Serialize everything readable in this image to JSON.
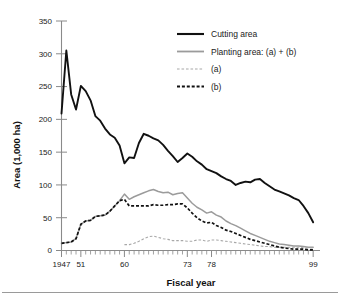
{
  "chart_data": {
    "type": "line",
    "title": "",
    "xlabel": "Fiscal year",
    "ylabel": "Area (1,000 ha)",
    "xlim": [
      1947,
      2000
    ],
    "ylim": [
      0,
      350
    ],
    "yticks": [
      0,
      50,
      100,
      150,
      200,
      250,
      300,
      350
    ],
    "ytick_labels": [
      "0",
      "50",
      "100",
      "150",
      "200",
      "250",
      "300",
      "350"
    ],
    "xticks": [
      1947,
      1951,
      1960,
      1973,
      1978,
      1999
    ],
    "xtick_labels": [
      "1947",
      "51",
      "60",
      "73",
      "78",
      "99"
    ],
    "x_minor_tick_step": 1,
    "grid": false,
    "legend_position": "upper right",
    "x": [
      1947,
      1948,
      1949,
      1950,
      1951,
      1952,
      1953,
      1954,
      1955,
      1956,
      1957,
      1958,
      1959,
      1960,
      1961,
      1962,
      1963,
      1964,
      1965,
      1966,
      1967,
      1968,
      1969,
      1970,
      1971,
      1972,
      1973,
      1974,
      1975,
      1976,
      1977,
      1978,
      1979,
      1980,
      1981,
      1982,
      1983,
      1984,
      1985,
      1986,
      1987,
      1988,
      1989,
      1990,
      1991,
      1992,
      1993,
      1994,
      1995,
      1996,
      1997,
      1998,
      1999
    ],
    "series": [
      {
        "name": "Cutting area",
        "color": "#111111",
        "style": "solid",
        "values": [
          209,
          305,
          238,
          215,
          251,
          243,
          229,
          205,
          198,
          186,
          177,
          172,
          160,
          133,
          142,
          141,
          164,
          178,
          175,
          171,
          168,
          161,
          152,
          144,
          135,
          141,
          148,
          143,
          136,
          131,
          124,
          121,
          118,
          113,
          109,
          106,
          100,
          103,
          105,
          104,
          108,
          109,
          103,
          98,
          93,
          90,
          87,
          84,
          80,
          77,
          68,
          57,
          43
        ]
      },
      {
        "name": "Planting area: (a) + (b)",
        "color": "#9b9b9b",
        "style": "solid",
        "values": [
          11,
          12,
          13,
          18,
          40,
          45,
          46,
          52,
          53,
          54,
          60,
          68,
          76,
          86,
          78,
          82,
          85,
          88,
          91,
          93,
          90,
          88,
          89,
          85,
          87,
          88,
          80,
          72,
          66,
          62,
          57,
          59,
          54,
          51,
          45,
          41,
          38,
          34,
          30,
          26,
          23,
          20,
          17,
          14,
          12,
          10,
          9,
          8,
          7,
          7,
          6,
          5,
          5
        ]
      },
      {
        "name": "(a)",
        "color": "#a8a8a8",
        "style": "dashed",
        "values": [
          0,
          0,
          0,
          0,
          0,
          0,
          0,
          0,
          0,
          0,
          0,
          0,
          0,
          9,
          9,
          11,
          14,
          18,
          21,
          22,
          20,
          18,
          17,
          15,
          15,
          15,
          14,
          14,
          16,
          16,
          14,
          16,
          16,
          15,
          14,
          13,
          12,
          11,
          10,
          9,
          8,
          7,
          6,
          6,
          5,
          5,
          5,
          5,
          5,
          5,
          4,
          4,
          4
        ]
      },
      {
        "name": "(b)",
        "color": "#111111",
        "style": "dashed",
        "values": [
          11,
          12,
          13,
          18,
          40,
          45,
          46,
          52,
          53,
          54,
          60,
          68,
          76,
          78,
          68,
          68,
          68,
          68,
          68,
          70,
          69,
          69,
          70,
          70,
          71,
          71,
          65,
          57,
          50,
          45,
          42,
          43,
          38,
          35,
          31,
          29,
          26,
          23,
          20,
          17,
          15,
          13,
          11,
          9,
          7,
          5,
          4,
          3,
          2,
          2,
          2,
          1,
          1
        ]
      }
    ]
  },
  "legend": {
    "items": [
      {
        "label": "Cutting area"
      },
      {
        "label": "Planting area: (a) + (b)"
      },
      {
        "label": "(a)"
      },
      {
        "label": "(b)"
      }
    ]
  }
}
